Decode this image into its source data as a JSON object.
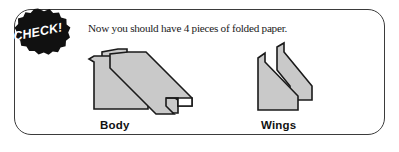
{
  "panel": {
    "border_color": "#3b3b3b",
    "background": "#ffffff"
  },
  "badge": {
    "label": "CHECK!",
    "fill_color": "#111111",
    "text_color": "#ffffff",
    "shape": "scalloped-starburst"
  },
  "caption": {
    "text": "Now you should have 4 pieces of folded paper."
  },
  "figures": [
    {
      "id": "body",
      "label": "Body",
      "description": "two overlapping folded paper strips forming a crossed arrow shape",
      "fill_color": "#c9c9c9",
      "outline_color": "#1a1a1a"
    },
    {
      "id": "wings",
      "label": "Wings",
      "description": "two overlapping folded paper wing shapes",
      "fill_color": "#c9c9c9",
      "outline_color": "#1a1a1a"
    }
  ],
  "counts": {
    "pieces": 4
  }
}
